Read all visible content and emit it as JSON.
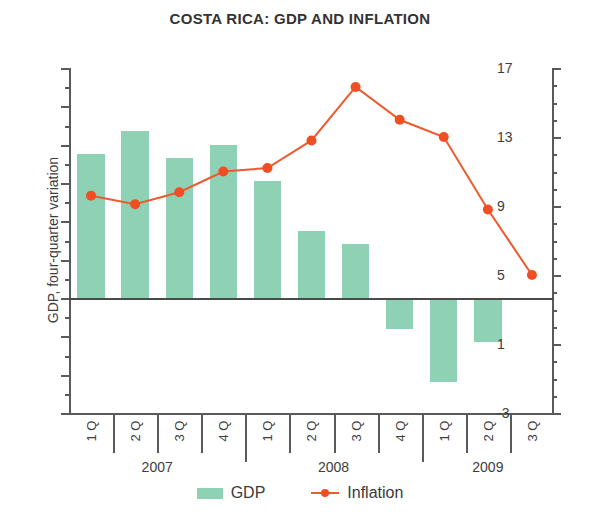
{
  "title": "COSTA RICA: GDP AND INFLATION",
  "legend": {
    "gdp_label": "GDP",
    "inflation_label": "Inflation"
  },
  "axes": {
    "left_title": "GDP, four-quarter variation",
    "right_title": "Inflation, 12-month variation",
    "left_ticks": [
      "12",
      "10",
      "8",
      "6",
      "4",
      "2",
      "0",
      "-2",
      "-4",
      "-6"
    ],
    "right_ticks": [
      "17",
      "13",
      "9",
      "5",
      "1",
      "-3"
    ]
  },
  "years": [
    "2007",
    "2008",
    "2009"
  ],
  "quarters": [
    "1 Q",
    "2 Q",
    "3 Q",
    "4 Q",
    "1 Q",
    "2 Q",
    "3 Q",
    "4 Q",
    "1 Q",
    "2 Q",
    "3 Q"
  ],
  "colors": {
    "gdp_bar": "#8ed1b4",
    "inflation_line": "#ee5a30",
    "inflation_marker": "#f04e23",
    "axis": "#5a5a5a",
    "text": "#3d3d3d"
  },
  "chart_data": {
    "type": "bar",
    "title": "COSTA RICA: GDP AND INFLATION",
    "xlabel": "",
    "ylabel": "GDP, four-quarter variation",
    "y2label": "Inflation, 12-month variation",
    "categories": [
      "2007 1 Q",
      "2007 2 Q",
      "2007 3 Q",
      "2007 4 Q",
      "2008 1 Q",
      "2008 2 Q",
      "2008 3 Q",
      "2008 4 Q",
      "2009 1 Q",
      "2009 2 Q",
      "2009 3 Q"
    ],
    "ylim": [
      -6,
      12
    ],
    "y2lim": [
      -3,
      17
    ],
    "yticks": [
      12,
      10,
      8,
      6,
      4,
      2,
      0,
      -2,
      -4,
      -6
    ],
    "y2ticks": [
      17,
      13,
      9,
      5,
      1,
      -3
    ],
    "grid": false,
    "legend_position": "bottom",
    "series": [
      {
        "name": "GDP",
        "type": "bar",
        "axis": "left",
        "color": "#8ed1b4",
        "values": [
          7.5,
          8.7,
          7.3,
          8.0,
          6.1,
          3.5,
          2.8,
          -1.6,
          -4.4,
          -2.3,
          null
        ]
      },
      {
        "name": "Inflation",
        "type": "line",
        "axis": "right",
        "color": "#ee5a30",
        "values": [
          9.6,
          9.1,
          9.8,
          11.0,
          11.2,
          12.8,
          15.9,
          14.0,
          13.0,
          8.8,
          5.0
        ]
      }
    ]
  }
}
